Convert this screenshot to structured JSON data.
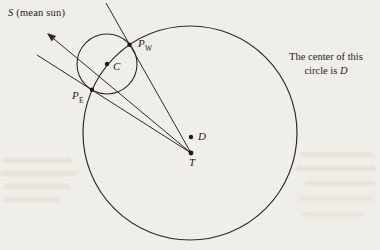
{
  "figure": {
    "background_color": "#f0eee8",
    "line_color": "#2e2b26",
    "dot_color": "#1c1a16"
  },
  "labels": {
    "mean_sun": {
      "main": "S",
      "rest": " (mean sun)"
    },
    "pw": {
      "main": "P",
      "sub": "W"
    },
    "pe": {
      "main": "P",
      "sub": "E"
    },
    "c": "C",
    "d": "D",
    "t": "T"
  },
  "caption": {
    "line1": "The center of this",
    "line2_prefix": "circle is ",
    "line2_var": "D"
  }
}
